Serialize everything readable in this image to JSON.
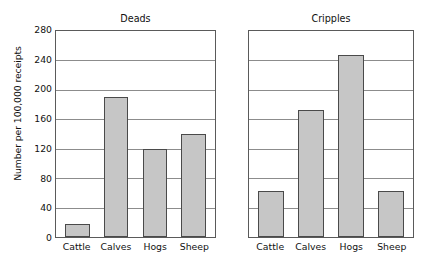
{
  "chart_data": {
    "type": "bar",
    "title": "",
    "xlabel": "",
    "ylabel": "Number per 100,000 receipts",
    "ylim": [
      0,
      280
    ],
    "yticks": [
      280,
      240,
      200,
      160,
      120,
      80,
      40,
      0
    ],
    "grid": true,
    "legend": "none",
    "categories": [
      "Cattle",
      "Calves",
      "Hogs",
      "Sheep"
    ],
    "panels": [
      {
        "title": "Deads",
        "show_yticklabels": true,
        "values": [
          18,
          190,
          120,
          140
        ]
      },
      {
        "title": "Cripples",
        "show_yticklabels": false,
        "values": [
          63,
          172,
          248,
          62
        ]
      }
    ],
    "colors": {
      "bar_fill": "#c6c6c6",
      "bar_edge": "#4a4a4a",
      "axis": "#5a5a5a",
      "grid": "#8c8c8c",
      "text": "#111111",
      "background": "#ffffff"
    }
  }
}
